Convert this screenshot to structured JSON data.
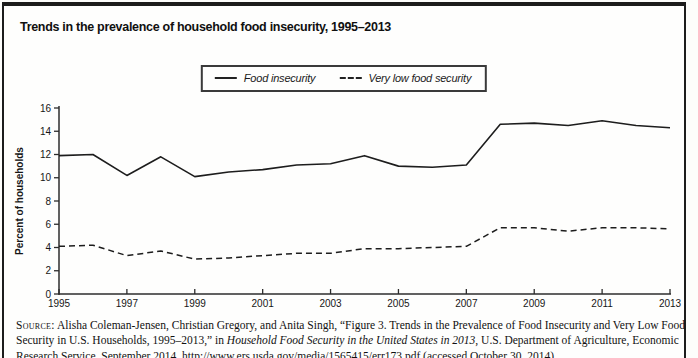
{
  "figure_title": "Trends in the prevalence of household food insecurity, 1995–2013",
  "legend": {
    "items": [
      {
        "label": "Food insecurity",
        "swatch": "solid-line"
      },
      {
        "label": "Very low food security",
        "swatch": "dashed-line"
      }
    ]
  },
  "chart_data": {
    "type": "line",
    "x": [
      1995,
      1996,
      1997,
      1998,
      1999,
      2000,
      2001,
      2002,
      2003,
      2004,
      2005,
      2006,
      2007,
      2008,
      2009,
      2010,
      2011,
      2012,
      2013
    ],
    "series": [
      {
        "name": "Food insecurity",
        "line_style": "solid",
        "values": [
          11.9,
          12.0,
          10.2,
          11.8,
          10.1,
          10.5,
          10.7,
          11.1,
          11.2,
          11.9,
          11.0,
          10.9,
          11.1,
          14.6,
          14.7,
          14.5,
          14.9,
          14.5,
          14.3
        ]
      },
      {
        "name": "Very low food security",
        "line_style": "dashed",
        "values": [
          4.1,
          4.2,
          3.3,
          3.7,
          3.0,
          3.1,
          3.3,
          3.5,
          3.5,
          3.9,
          3.9,
          4.0,
          4.1,
          5.7,
          5.7,
          5.4,
          5.7,
          5.7,
          5.6
        ]
      }
    ],
    "title": "Trends in the prevalence of household food insecurity, 1995–2013",
    "xlabel": "",
    "ylabel": "Percent of households",
    "ylim": [
      0,
      16
    ],
    "yticks": [
      0,
      2,
      4,
      6,
      8,
      10,
      12,
      14,
      16
    ],
    "xticks": [
      1995,
      1997,
      1999,
      2001,
      2003,
      2005,
      2007,
      2009,
      2011,
      2013
    ],
    "grid": false,
    "legend_position": "top-center",
    "colors": {
      "line": "#1d1d1d",
      "axis": "#2c2c2c",
      "text": "#161616"
    }
  },
  "source_note": {
    "label": "Source:",
    "text_before_title": " Alisha Coleman-Jensen, Christian Gregory, and Anita Singh, “Figure 3. Trends in the Prevalence of Food Insecurity and Very Low Food Security in U.S. Households, 1995–2013,” in ",
    "publication_title": "Household Food Security in the United States in 2013",
    "text_after_title": ", U.S. Department of Agriculture, Economic Research Service, September 2014, http://www.ers.usda.gov/media/1565415/err173.pdf (accessed October 30, 2014)"
  }
}
